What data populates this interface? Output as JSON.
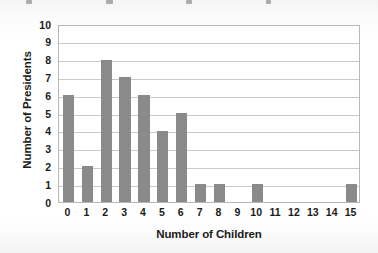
{
  "chart_data": {
    "type": "bar",
    "title": "",
    "xlabel": "Number of Children",
    "ylabel": "Number of Presidents",
    "categories": [
      "0",
      "1",
      "2",
      "3",
      "4",
      "5",
      "6",
      "7",
      "8",
      "9",
      "10",
      "11",
      "12",
      "13",
      "14",
      "15"
    ],
    "values": [
      6,
      2,
      8,
      7,
      6,
      4,
      5,
      1,
      1,
      0,
      1,
      0,
      0,
      0,
      0,
      1
    ],
    "ylim": [
      0,
      10
    ],
    "yticks": [
      "0",
      "1",
      "2",
      "3",
      "4",
      "5",
      "6",
      "7",
      "8",
      "9",
      "10"
    ],
    "ytick_values": [
      0,
      1,
      2,
      3,
      4,
      5,
      6,
      7,
      8,
      9,
      10
    ],
    "grid": "horizontal",
    "legend": "none",
    "bar_color": "#8a8a8a",
    "grid_color": "#c9c9c9",
    "frame_color": "#b7b7b7",
    "background_color": "#ffffff",
    "text_color": "#1a1a1a"
  }
}
